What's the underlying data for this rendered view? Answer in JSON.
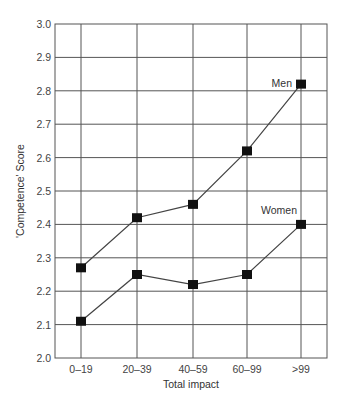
{
  "chart_data": {
    "type": "line",
    "title": "",
    "xlabel": "Total impact",
    "ylabel": "'Competence' Score",
    "categories": [
      "0–19",
      "20–39",
      "40–59",
      "60–99",
      ">99"
    ],
    "ylim": [
      2.0,
      3.0
    ],
    "yticks": [
      "2.0",
      "2.1",
      "2.2",
      "2.3",
      "2.4",
      "2.5",
      "2.6",
      "2.7",
      "2.8",
      "2.9",
      "3.0"
    ],
    "grid": true,
    "legend": "inline labels",
    "series": [
      {
        "name": "Men",
        "values": [
          2.27,
          2.42,
          2.46,
          2.62,
          2.82
        ],
        "marker": "square"
      },
      {
        "name": "Women",
        "values": [
          2.11,
          2.25,
          2.22,
          2.25,
          2.4
        ],
        "marker": "square"
      }
    ]
  },
  "colors": {
    "line": "#444444",
    "marker": "#111111",
    "grid": "#555555"
  }
}
